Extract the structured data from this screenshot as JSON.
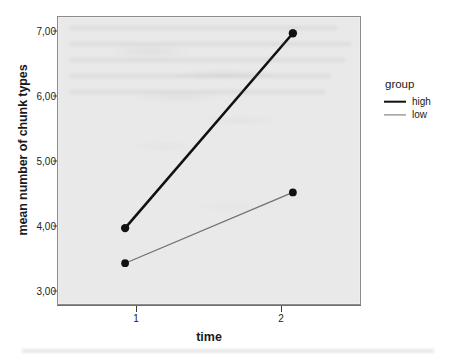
{
  "chart_data": {
    "type": "line",
    "title": "",
    "xlabel": "time",
    "ylabel": "mean number of chunk types",
    "x": [
      1,
      2
    ],
    "xtick_labels": [
      "1",
      "2"
    ],
    "ytick_labels": [
      "3,00",
      "4,00",
      "5,00",
      "6,00",
      "7,00"
    ],
    "ytick_values": [
      3.0,
      4.0,
      5.0,
      6.0,
      7.0
    ],
    "ylim": [
      2.83,
      7.25
    ],
    "xlim": [
      0.6,
      2.4
    ],
    "grid": false,
    "legend_position": "right",
    "legend_title": "group",
    "series": [
      {
        "name": "high",
        "values": [
          4.0,
          7.0
        ],
        "color": "#111111",
        "line_width": 2.6,
        "marker": "filled-circle"
      },
      {
        "name": "low",
        "values": [
          3.46,
          4.55
        ],
        "color": "#6f6f6f",
        "line_width": 1.2,
        "marker": "filled-circle"
      }
    ]
  },
  "axes": {
    "y_title": "mean number of chunk types",
    "x_title": "time",
    "y_ticks": [
      {
        "label": "7,00",
        "value": 7.0
      },
      {
        "label": "6,00",
        "value": 6.0
      },
      {
        "label": "5,00",
        "value": 5.0
      },
      {
        "label": "4,00",
        "value": 4.0
      },
      {
        "label": "3,00",
        "value": 3.0
      }
    ],
    "x_ticks": [
      {
        "label": "1",
        "value": 1
      },
      {
        "label": "2",
        "value": 2
      }
    ]
  },
  "legend": {
    "title": "group",
    "entries": [
      {
        "label": "high",
        "style": "thick"
      },
      {
        "label": "low",
        "style": "thin"
      }
    ]
  },
  "colors": {
    "plot_background": "#e9e9e9",
    "page_background": "#ffffff",
    "series_high": "#111111",
    "series_low": "#6f6f6f",
    "axis": "#3b3b3b",
    "frame": "#8c8c8c"
  }
}
